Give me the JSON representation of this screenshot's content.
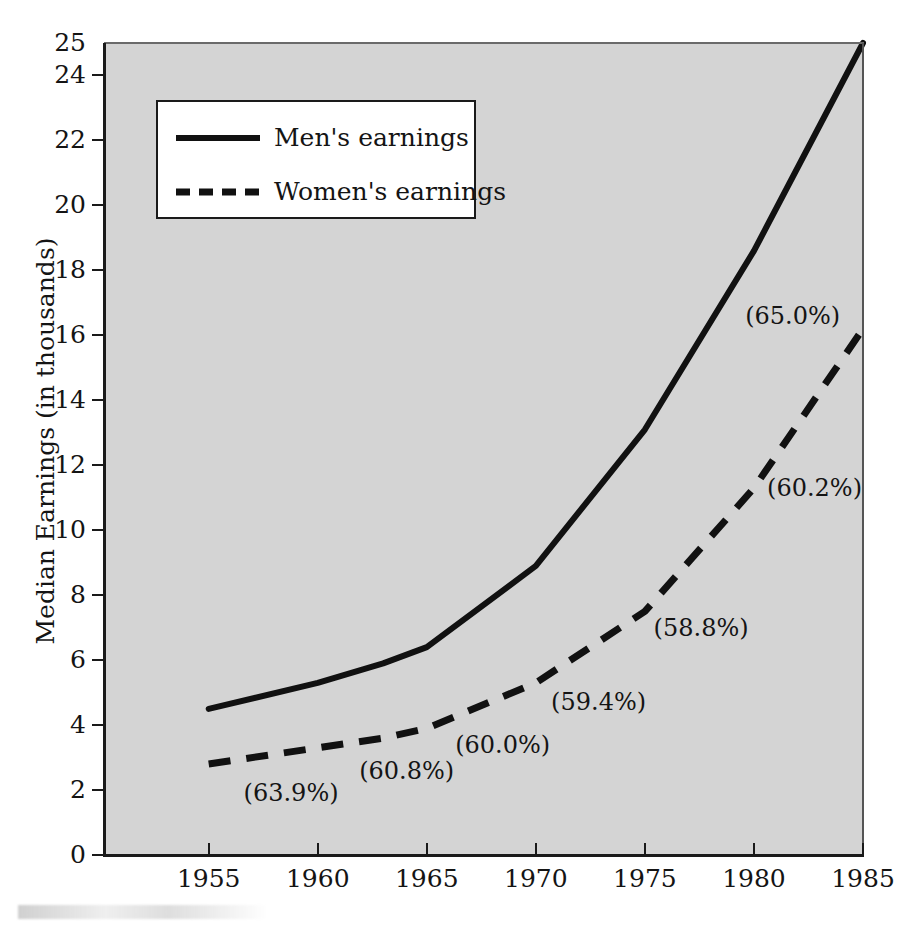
{
  "chart_data": {
    "type": "line",
    "title": "",
    "xlabel": "",
    "ylabel": "Median Earnings (in thousands)",
    "xlim": [
      1950.2,
      1985
    ],
    "ylim": [
      0,
      25
    ],
    "grid": false,
    "legend_position": "upper-left-inside",
    "x_ticks": [
      1955,
      1960,
      1965,
      1970,
      1975,
      1980,
      1985
    ],
    "x_tick_labels": [
      "1955",
      "1960",
      "1965",
      "1970",
      "1975",
      "1980",
      "1985"
    ],
    "y_ticks": [
      0,
      2,
      4,
      6,
      8,
      10,
      12,
      14,
      16,
      18,
      20,
      22,
      24,
      25
    ],
    "y_tick_labels": [
      "0",
      "2",
      "4",
      "6",
      "8",
      "10",
      "12",
      "14",
      "16",
      "18",
      "20",
      "22",
      "24",
      "25"
    ],
    "x": [
      1955,
      1960,
      1963,
      1965,
      1970,
      1975,
      1980,
      1985
    ],
    "series": [
      {
        "name": "Men's earnings",
        "style": "solid",
        "color": "#111111",
        "values": [
          4.5,
          5.3,
          5.9,
          6.4,
          8.9,
          13.1,
          18.6,
          25.0
        ]
      },
      {
        "name": "Women's earnings",
        "style": "dashed",
        "color": "#111111",
        "values": [
          2.8,
          3.3,
          3.6,
          3.9,
          5.3,
          7.5,
          11.3,
          16.2
        ]
      }
    ],
    "annotations": [
      {
        "text": "(63.9%)",
        "x": 1956.6,
        "y": 1.9
      },
      {
        "text": "(60.8%)",
        "x": 1961.9,
        "y": 2.6
      },
      {
        "text": "(60.0%)",
        "x": 1966.3,
        "y": 3.4
      },
      {
        "text": "(59.4%)",
        "x": 1970.7,
        "y": 4.7
      },
      {
        "text": "(58.8%)",
        "x": 1975.4,
        "y": 7.0
      },
      {
        "text": "(60.2%)",
        "x": 1980.6,
        "y": 11.3
      },
      {
        "text": "(65.0%)",
        "x": 1979.6,
        "y": 16.6
      }
    ]
  },
  "legend": {
    "items": [
      {
        "label": "Men's earnings",
        "style": "solid"
      },
      {
        "label": "Women's earnings",
        "style": "dashed"
      }
    ]
  },
  "colors": {
    "plot_background": "#d4d4d4",
    "page_background": "#ffffff",
    "line": "#111111",
    "axis": "#1a1a1a",
    "text": "#141414"
  }
}
